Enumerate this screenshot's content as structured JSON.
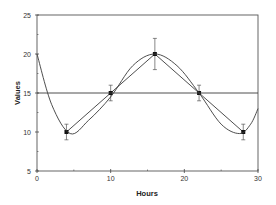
{
  "chart_data": {
    "type": "line",
    "title": "",
    "xlabel": "Hours",
    "ylabel": "Values",
    "xlim": [
      0,
      30
    ],
    "ylim": [
      5,
      25
    ],
    "x_ticks": [
      0,
      10,
      20,
      30
    ],
    "x_tick_labels": [
      "0",
      "10",
      "20",
      "30"
    ],
    "y_ticks": [
      5,
      10,
      15,
      20,
      25
    ],
    "y_tick_labels": [
      "5",
      "10",
      "15",
      "20",
      "25"
    ],
    "grid": false,
    "legend": null,
    "series": [
      {
        "name": "observed",
        "style": "line-with-markers-and-error-bars",
        "x": [
          4,
          10,
          16,
          22,
          28
        ],
        "y": [
          10,
          15,
          20,
          15,
          10
        ],
        "error": [
          1,
          1,
          2,
          1,
          1
        ]
      },
      {
        "name": "fitted curve",
        "style": "smooth-line",
        "x": [
          0,
          2,
          4.5,
          7,
          10,
          13,
          16,
          19,
          22,
          25,
          27.5,
          29,
          30
        ],
        "y": [
          20,
          13.5,
          9.8,
          11.5,
          14.5,
          18.5,
          20,
          18.5,
          15,
          11,
          9.8,
          11,
          13
        ]
      },
      {
        "name": "mesor",
        "style": "horizontal-line",
        "x": [
          0,
          30
        ],
        "y": [
          15,
          15
        ]
      }
    ]
  }
}
